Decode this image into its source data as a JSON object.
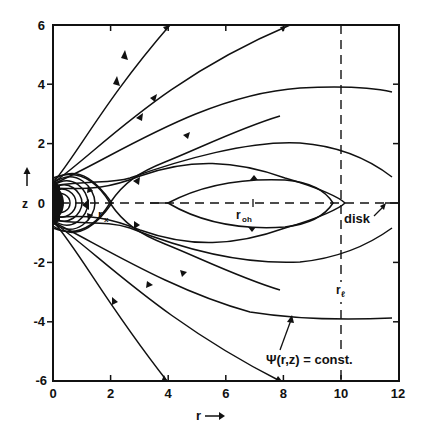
{
  "figure": {
    "x_axis": {
      "label": "r",
      "label_arrow": "→",
      "ticks": [
        "0",
        "2",
        "4",
        "6",
        "8",
        "10",
        "12"
      ],
      "range": [
        0,
        12
      ]
    },
    "y_axis": {
      "label": "z",
      "label_arrow": "↑",
      "ticks": [
        "-6",
        "-4",
        "-2",
        "0",
        "2",
        "4",
        "6"
      ],
      "range": [
        -6,
        6
      ]
    },
    "annotations": {
      "r_x": "r",
      "r_x_sub": "x",
      "r_oh": "r",
      "r_oh_sub": "oh",
      "r_l": "r",
      "r_l_sub": "ℓ",
      "disk": "disk",
      "psi": "Ψ(r,z) = const."
    },
    "reference_lines": {
      "disk_plane_z": 0,
      "light_cylinder_r": 10
    },
    "colors": {
      "ink": "#111111",
      "background": "#ffffff"
    }
  }
}
